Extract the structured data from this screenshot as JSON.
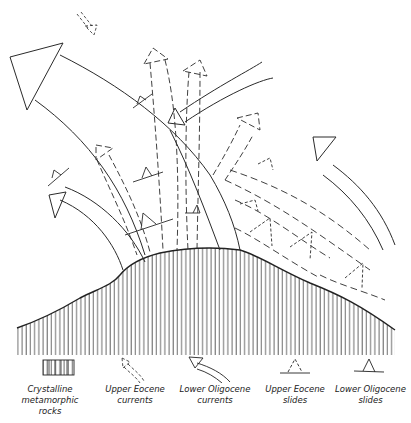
{
  "figure": {
    "type": "geological schematic"
  },
  "legend": {
    "items": [
      {
        "key": "crystalline",
        "label": "Crystalline metamorphic\nrocks",
        "symbol": "vertical-hatch-box"
      },
      {
        "key": "upper_eocene_currents",
        "label": "Upper Eocene\ncurrents",
        "symbol": "dashed-curved-arrow"
      },
      {
        "key": "lower_oligocene_currents",
        "label": "Lower Oligocene\ncurrents",
        "symbol": "solid-curved-arrow"
      },
      {
        "key": "upper_eocene_slides",
        "label": "Upper Eocene\nslides",
        "symbol": "dashed-triangle-on-line"
      },
      {
        "key": "lower_oligocene_slides",
        "label": "Lower Oligocene\nslides",
        "symbol": "solid-triangle-on-line"
      }
    ]
  },
  "colors": {
    "ink": "#2a2a2a",
    "background": "#ffffff"
  }
}
